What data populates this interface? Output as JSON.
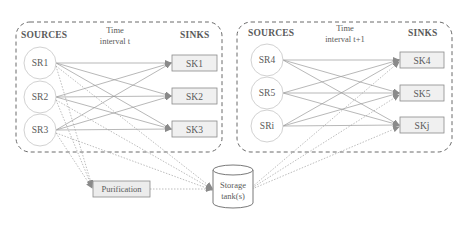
{
  "diagram": {
    "type": "flow-network",
    "groups": [
      {
        "id": "interval-t",
        "sources_label": "SOURCES",
        "time_label_line1": "Time",
        "time_label_line2": "interval t",
        "sinks_label": "SINKS",
        "sources": [
          "SR1",
          "SR2",
          "SR3"
        ],
        "sinks": [
          "SK1",
          "SK2",
          "SK3"
        ]
      },
      {
        "id": "interval-t+1",
        "sources_label": "SOURCES",
        "time_label_line1": "Time",
        "time_label_line2": "interval t+1",
        "sinks_label": "SINKS",
        "sources": [
          "SR4",
          "SR5",
          "SRi"
        ],
        "sinks": [
          "SK4",
          "SK5",
          "SKj"
        ]
      }
    ],
    "purification": {
      "label": "Purification"
    },
    "storage": {
      "label_line1": "Storage",
      "label_line2": "tank(s)"
    },
    "edges": {
      "solid": "every source to every sink within the same time interval",
      "dotted": [
        "SR1, SR2, SR3 -> Purification",
        "SR1, SR2, SR3 -> Storage tank(s)",
        "Purification -> Storage tank(s)",
        "Storage tank(s) -> SK4, SK5, SKj"
      ]
    },
    "colors": {
      "line": "#8a8a8a",
      "box_fill": "#efefef",
      "text": "#5a5a5a",
      "group_border": "#6a6a6a"
    }
  }
}
